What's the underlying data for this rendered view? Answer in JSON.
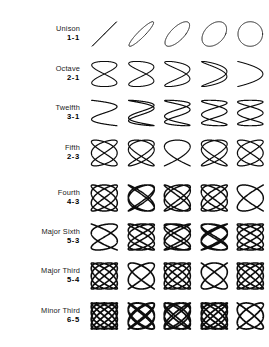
{
  "figure": {
    "background_color": "#ffffff",
    "stroke_color": "#0d0d0d",
    "columns": 5,
    "rows": 8,
    "phase_labels": [
      "0",
      "1/8",
      "1/4",
      "3/8",
      "1/2"
    ]
  },
  "chart_data": {
    "type": "line",
    "subtitle": "",
    "xlabel": "",
    "ylabel": "",
    "grid": false,
    "legend_position": "none",
    "xlim": [
      -1,
      1
    ],
    "ylim": [
      -1,
      1
    ],
    "phases_deg": [
      0,
      22.5,
      45,
      67.5,
      90
    ],
    "series": [
      {
        "name": "Unison",
        "ratio": "1-1",
        "a": 1,
        "b": 1,
        "values": [
          0,
          22.5,
          45,
          67.5,
          90
        ]
      },
      {
        "name": "Octave",
        "ratio": "2-1",
        "a": 2,
        "b": 1,
        "values": [
          0,
          22.5,
          45,
          67.5,
          90
        ]
      },
      {
        "name": "Twelfth",
        "ratio": "3-1",
        "a": 3,
        "b": 1,
        "values": [
          0,
          22.5,
          45,
          67.5,
          90
        ]
      },
      {
        "name": "Fifth",
        "ratio": "2-3",
        "a": 3,
        "b": 2,
        "values": [
          0,
          22.5,
          45,
          67.5,
          90
        ]
      },
      {
        "name": "Fourth",
        "ratio": "4-3",
        "a": 4,
        "b": 3,
        "values": [
          0,
          22.5,
          45,
          67.5,
          90
        ]
      },
      {
        "name": "Major Sixth",
        "ratio": "5-3",
        "a": 5,
        "b": 3,
        "values": [
          0,
          22.5,
          45,
          67.5,
          90
        ]
      },
      {
        "name": "Major Third",
        "ratio": "5-4",
        "a": 5,
        "b": 4,
        "values": [
          0,
          22.5,
          45,
          67.5,
          90
        ]
      },
      {
        "name": "Minor Third",
        "ratio": "6-5",
        "a": 6,
        "b": 5,
        "values": [
          0,
          22.5,
          45,
          67.5,
          90
        ]
      }
    ]
  },
  "rows": [
    {
      "name": "Unison",
      "ratio": "1-1",
      "a": 1,
      "b": 1,
      "y": 14,
      "stroke": 1.0,
      "scale": 0.84
    },
    {
      "name": "Octave",
      "ratio": "2-1",
      "a": 2,
      "b": 1,
      "y": 54,
      "stroke": 1.15,
      "scale": 0.86
    },
    {
      "name": "Twelfth",
      "ratio": "3-1",
      "a": 3,
      "b": 1,
      "y": 93,
      "stroke": 1.3,
      "scale": 0.87
    },
    {
      "name": "Fifth",
      "ratio": "2-3",
      "a": 3,
      "b": 2,
      "y": 133,
      "stroke": 1.35,
      "scale": 0.88
    },
    {
      "name": "Fourth",
      "ratio": "4-3",
      "a": 4,
      "b": 3,
      "y": 178,
      "stroke": 1.6,
      "scale": 0.89
    },
    {
      "name": "Major Sixth",
      "ratio": "5-3",
      "a": 5,
      "b": 3,
      "y": 217,
      "stroke": 1.7,
      "scale": 0.89
    },
    {
      "name": "Major Third",
      "ratio": "5-4",
      "a": 5,
      "b": 4,
      "y": 256,
      "stroke": 1.75,
      "scale": 0.89
    },
    {
      "name": "Minor Third",
      "ratio": "6-5",
      "a": 6,
      "b": 5,
      "y": 296,
      "stroke": 1.9,
      "scale": 0.89
    }
  ]
}
